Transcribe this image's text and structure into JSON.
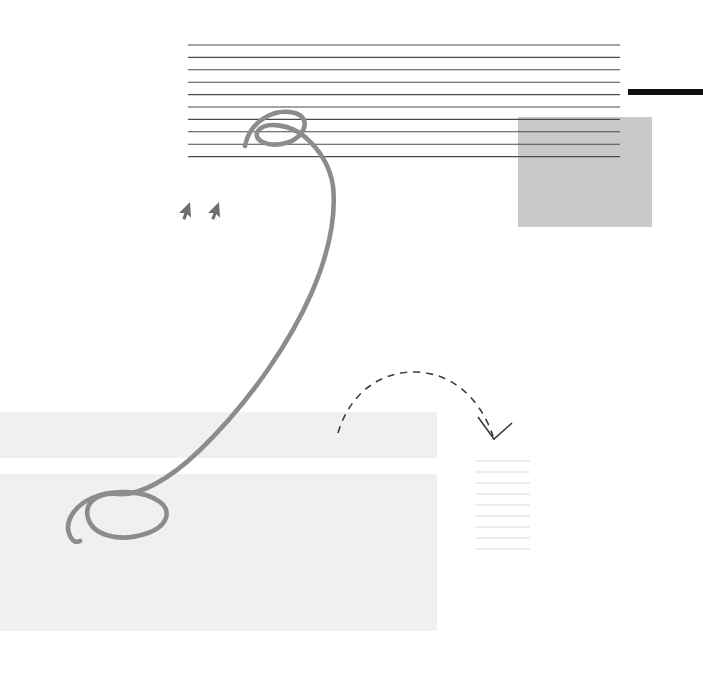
{
  "canvas": {
    "width": 703,
    "height": 674,
    "background": "#ffffff",
    "title": "Annotated document sketch"
  },
  "palette": {
    "rule_line": "#4a4a4a",
    "accent_bar": "#111111",
    "gray_block": "#c9c9c9",
    "faint_block": "#f0f0f0",
    "faint_line": "#dcdcdc",
    "ink_stroke": "#8c8c8c",
    "dashed_stroke": "#3c3c3c",
    "cursor_fill": "#6e6e6e"
  },
  "text_block_top": {
    "name": "top-ruled-text-block",
    "line_count": 10,
    "x_start": 188,
    "x_end": 620,
    "y_first": 45,
    "line_spacing": 12.4,
    "stroke_width": 1.1,
    "color": "#4a4a4a"
  },
  "accent_bar": {
    "name": "right-accent-bar",
    "x": 628,
    "y": 89,
    "width": 75,
    "height": 6,
    "color": "#111111"
  },
  "gray_block": {
    "name": "gray-highlight-rectangle",
    "x": 518,
    "y": 117,
    "width": 134,
    "height": 110,
    "color": "#c9c9c9"
  },
  "cursors": [
    {
      "name": "cursor-arrow-left",
      "x": 190,
      "y": 202,
      "rotation": 45,
      "scale": 1.0,
      "color": "#6e6e6e"
    },
    {
      "name": "cursor-arrow-right",
      "x": 219,
      "y": 202,
      "rotation": 45,
      "scale": 1.0,
      "color": "#6e6e6e"
    }
  ],
  "ink_swoosh": {
    "name": "hand-drawn-swoosh-annotation",
    "color": "#8c8c8c",
    "stroke_width": 4.6,
    "top_loop_center": {
      "x": 283,
      "y": 130
    },
    "bottom_loop_center": {
      "x": 115,
      "y": 518
    },
    "rightmost_x": 333,
    "path": "M 245 146 C 250 120 275 108 295 113 C 312 118 305 138 286 143 C 268 148 252 140 258 131 C 265 121 290 124 305 137 C 320 150 330 166 333 186 C 336 215 330 250 312 292 C 292 338 252 400 200 450 C 168 481 138 496 118 494 C 96 492 84 504 88 518 C 93 536 120 542 145 534 C 168 527 172 511 160 502 C 144 490 112 489 92 498 C 72 507 64 524 70 536 C 73 542 76 543 80 541"
  },
  "dashed_arrow": {
    "name": "dashed-curved-arrow",
    "color": "#3c3c3c",
    "stroke_width": 1.6,
    "dash_pattern": "7 6",
    "start": {
      "x": 338,
      "y": 433
    },
    "end": {
      "x": 494,
      "y": 437
    },
    "apex": {
      "x": 415,
      "y": 372
    },
    "path": "M 338 433 C 350 392 382 371 416 372 C 452 373 480 398 493 436",
    "arrowhead": "M 478 417 L 494 439 L 512 423"
  },
  "faint_blocks": [
    {
      "name": "faint-content-block-upper",
      "x": 0,
      "y": 412,
      "width": 437,
      "height": 46,
      "color": "#f0f0f0"
    },
    {
      "name": "faint-content-block-lower",
      "x": 0,
      "y": 474,
      "width": 437,
      "height": 157,
      "color": "#f0f0f0"
    }
  ],
  "text_block_bottom_right": {
    "name": "bottom-right-ruled-text-block",
    "line_count": 9,
    "x_start": 475,
    "x_end": 530,
    "y_first": 461,
    "line_spacing": 11,
    "stroke_width": 1.1,
    "color": "#dcdcdc"
  }
}
